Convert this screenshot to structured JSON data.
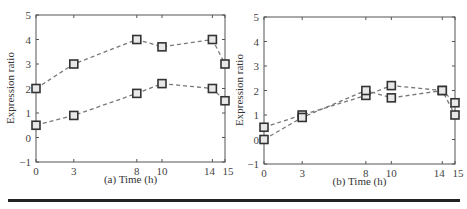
{
  "chart_data": [
    {
      "type": "line",
      "panel": "a",
      "xlabel": "(a) Time (h)",
      "ylabel": "Expression ratio",
      "x": [
        0,
        3,
        8,
        10,
        14,
        15
      ],
      "xticks": [
        "0",
        "3",
        "8",
        "10",
        "14",
        "15"
      ],
      "yticks": [
        "-1",
        "0",
        "1",
        "2",
        "3",
        "4",
        "5"
      ],
      "ylim": [
        -1,
        5
      ],
      "xlim": [
        0,
        15
      ],
      "grid": false,
      "series": [
        {
          "name": "series-1",
          "values": [
            2.0,
            3.0,
            4.0,
            3.7,
            4.0,
            3.0
          ]
        },
        {
          "name": "series-2",
          "values": [
            0.5,
            0.9,
            1.8,
            2.2,
            2.0,
            1.5
          ]
        }
      ]
    },
    {
      "type": "line",
      "panel": "b",
      "xlabel": "(b) Time (h)",
      "ylabel": "Expression ratio",
      "x": [
        0,
        3,
        8,
        10,
        14,
        15
      ],
      "xticks": [
        "0",
        "3",
        "8",
        "10",
        "14",
        "15"
      ],
      "yticks": [
        "-1",
        "0",
        "1",
        "2",
        "3",
        "4",
        "5"
      ],
      "ylim": [
        -1,
        5
      ],
      "xlim": [
        0,
        15
      ],
      "grid": false,
      "series": [
        {
          "name": "series-1",
          "values": [
            0.5,
            1.0,
            1.8,
            2.2,
            2.0,
            1.0
          ]
        },
        {
          "name": "series-2",
          "values": [
            0.0,
            0.9,
            2.0,
            1.7,
            2.0,
            1.5
          ]
        }
      ]
    }
  ]
}
